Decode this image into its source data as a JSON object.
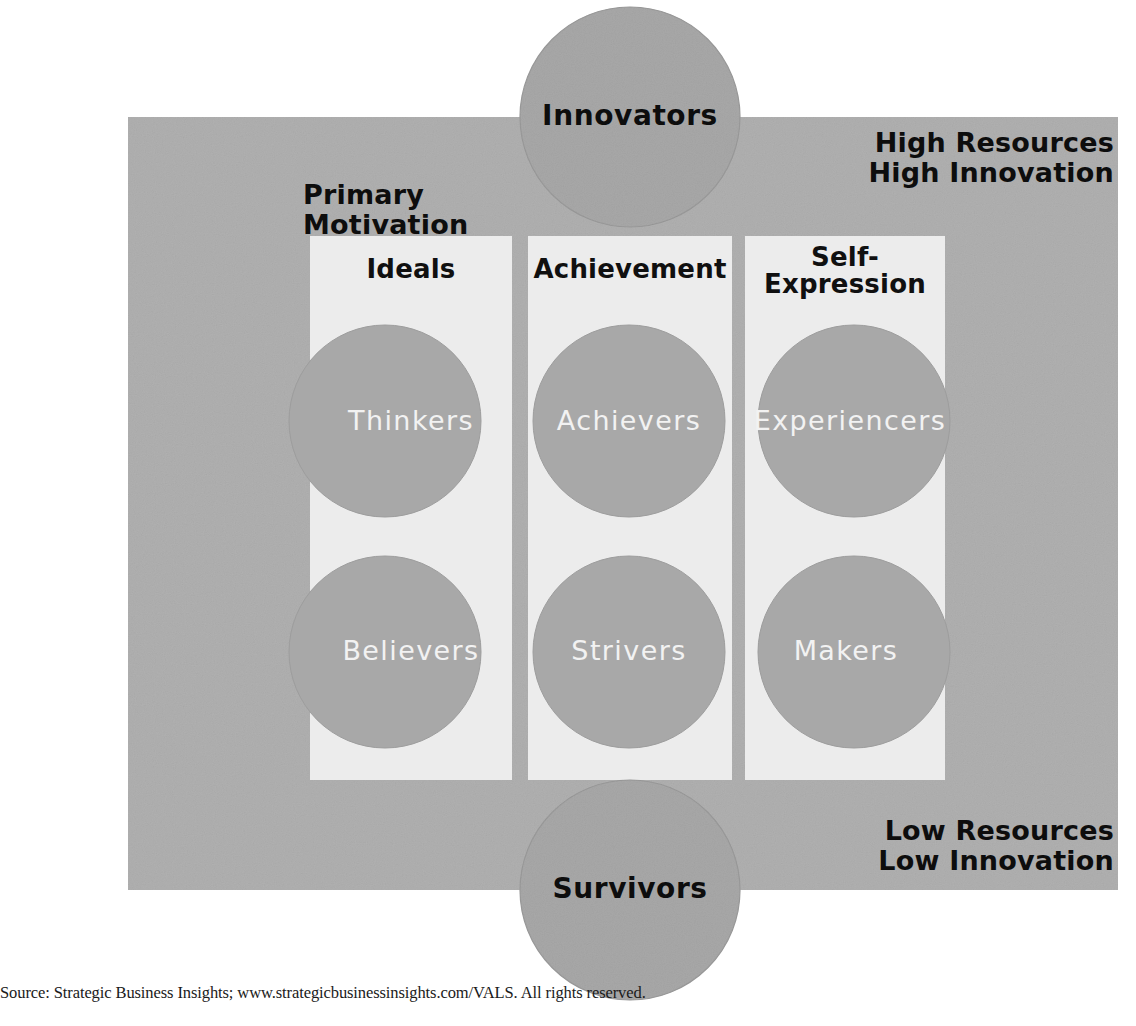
{
  "diagram": {
    "panel": {
      "background_color": "#b0b0b0",
      "column_band_color": "#ececec"
    },
    "corner_labels": {
      "top_right_line1": "High Resources",
      "top_right_line2": "High Innovation",
      "bottom_right_line1": "Low Resources",
      "bottom_right_line2": "Low Innovation"
    },
    "axis_label": {
      "line1": "Primary",
      "line2": "Motivation"
    },
    "columns": [
      {
        "id": "ideals",
        "header": "Ideals"
      },
      {
        "id": "achievement",
        "header": "Achievement"
      },
      {
        "id": "self-expression",
        "header_line1": "Self-",
        "header_line2": "Expression"
      }
    ],
    "poles": [
      {
        "id": "innovators",
        "label": "Innovators",
        "position": "top"
      },
      {
        "id": "survivors",
        "label": "Survivors",
        "position": "bottom"
      }
    ],
    "segments": [
      {
        "id": "thinkers",
        "label": "Thinkers",
        "column": "ideals",
        "row": 1
      },
      {
        "id": "achievers",
        "label": "Achievers",
        "column": "achievement",
        "row": 1
      },
      {
        "id": "experiencers",
        "label": "Experiencers",
        "column": "self-expression",
        "row": 1
      },
      {
        "id": "believers",
        "label": "Believers",
        "column": "ideals",
        "row": 2
      },
      {
        "id": "strivers",
        "label": "Strivers",
        "column": "achievement",
        "row": 2
      },
      {
        "id": "makers",
        "label": "Makers",
        "column": "self-expression",
        "row": 2
      }
    ],
    "colors": {
      "panel_gray": "#b0b0b0",
      "circle_gray": "#a8a8a8",
      "overlap_dark": "#55555a",
      "band_white": "#ececec",
      "label_black": "#0d0d0d",
      "label_white": "#f2f2f2"
    },
    "source_note": "Source: Strategic Business Insights; www.strategicbusinessinsights.com/VALS. All rights reserved."
  }
}
